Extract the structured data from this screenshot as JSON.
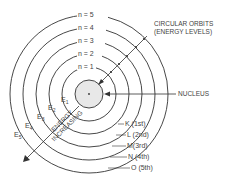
{
  "diagram": {
    "nucleus_label": "NUCLEUS",
    "orbits_label_line1": "CIRCULAR ORBITS",
    "orbits_label_line2": "(ENERGY LEVELS)",
    "energy_label_line1": "ENERGY",
    "energy_label_line2": "INCREASING",
    "quantum_numbers": [
      "n = 1",
      "n = 2",
      "n = 3",
      "n = 4",
      "n = 5"
    ],
    "shells": [
      "K (1st)",
      "L (2nd)",
      "M(3rd)",
      "N (4th)",
      "O (5th)"
    ],
    "energies": [
      {
        "base": "E",
        "sub": "1"
      },
      {
        "base": "E",
        "sub": "2"
      },
      {
        "base": "E",
        "sub": "3"
      },
      {
        "base": "E",
        "sub": "4"
      },
      {
        "base": "E",
        "sub": "5"
      }
    ],
    "colors": {
      "line": "#333333",
      "nucleus_fill": "#e6e6e6",
      "text": "#444444",
      "background": "#ffffff"
    }
  }
}
